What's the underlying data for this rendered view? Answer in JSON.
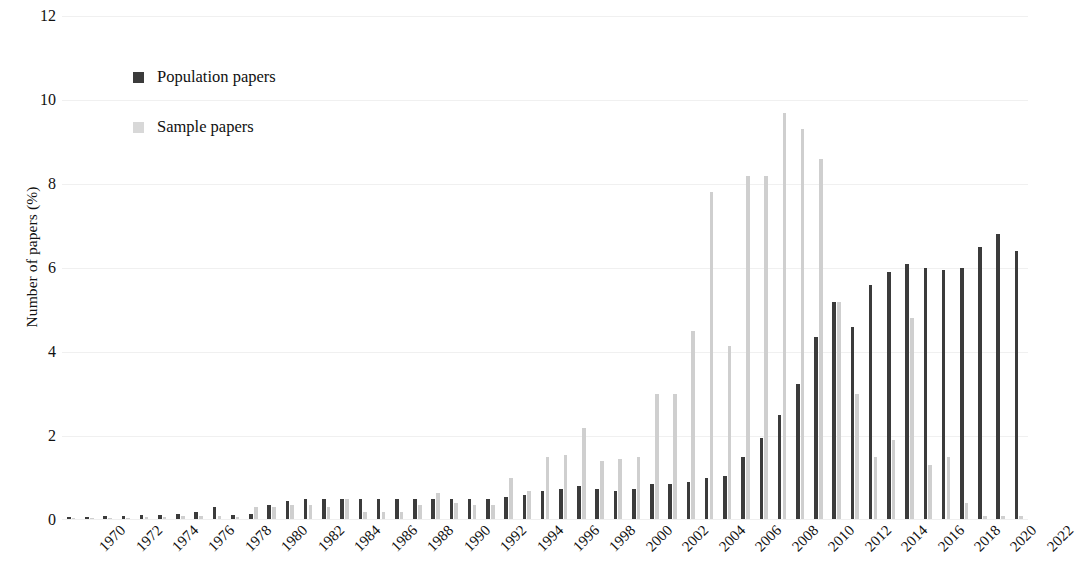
{
  "chart_data": {
    "type": "bar",
    "title": "",
    "xlabel": "",
    "ylabel": "Number of papers (%)",
    "ylim": [
      0,
      12
    ],
    "y_ticks": [
      0,
      2,
      4,
      6,
      8,
      10,
      12
    ],
    "grid": true,
    "legend_position": "upper-left-inside",
    "x": [
      1970,
      1971,
      1972,
      1973,
      1974,
      1975,
      1976,
      1977,
      1978,
      1979,
      1980,
      1981,
      1982,
      1983,
      1984,
      1985,
      1986,
      1987,
      1988,
      1989,
      1990,
      1991,
      1992,
      1993,
      1994,
      1995,
      1996,
      1997,
      1998,
      1999,
      2000,
      2001,
      2002,
      2003,
      2004,
      2005,
      2006,
      2007,
      2008,
      2009,
      2010,
      2011,
      2012,
      2013,
      2014,
      2015,
      2016,
      2017,
      2018,
      2019,
      2020,
      2021,
      2022
    ],
    "x_tick_labels": [
      "1970",
      "1972",
      "1974",
      "1976",
      "1978",
      "1980",
      "1982",
      "1984",
      "1986",
      "1988",
      "1990",
      "1992",
      "1994",
      "1996",
      "1998",
      "2000",
      "2002",
      "2004",
      "2006",
      "2008",
      "2010",
      "2012",
      "2014",
      "2016",
      "2018",
      "2020",
      "2022"
    ],
    "x_tick_values": [
      1970,
      1972,
      1974,
      1976,
      1978,
      1980,
      1982,
      1984,
      1986,
      1988,
      1990,
      1992,
      1994,
      1996,
      1998,
      2000,
      2002,
      2004,
      2006,
      2008,
      2010,
      2012,
      2014,
      2016,
      2018,
      2020,
      2022
    ],
    "series": [
      {
        "name": "Population papers",
        "color": "#3b3b3b",
        "values": [
          0.08,
          0.08,
          0.1,
          0.1,
          0.12,
          0.12,
          0.15,
          0.2,
          0.3,
          0.12,
          0.15,
          0.35,
          0.45,
          0.5,
          0.5,
          0.5,
          0.5,
          0.5,
          0.5,
          0.5,
          0.5,
          0.5,
          0.5,
          0.5,
          0.55,
          0.6,
          0.7,
          0.75,
          0.8,
          0.75,
          0.7,
          0.75,
          0.85,
          0.85,
          0.9,
          1.0,
          1.05,
          1.5,
          1.95,
          2.5,
          3.25,
          4.35,
          5.2,
          4.6,
          5.6,
          5.9,
          6.1,
          6.0,
          5.95,
          6.0,
          6.5,
          6.8,
          6.4
        ]
      },
      {
        "name": "Sample papers",
        "color": "#cfcfcf",
        "values": [
          0.05,
          0.05,
          0.05,
          0.05,
          0.08,
          0.08,
          0.1,
          0.1,
          0.1,
          0.08,
          0.3,
          0.3,
          0.35,
          0.35,
          0.3,
          0.5,
          0.2,
          0.2,
          0.2,
          0.35,
          0.65,
          0.4,
          0.35,
          0.35,
          1.0,
          0.7,
          1.5,
          1.55,
          2.2,
          1.4,
          1.45,
          1.5,
          3.0,
          3.0,
          4.5,
          7.8,
          4.15,
          8.2,
          8.2,
          9.7,
          9.3,
          8.6,
          5.2,
          3.0,
          1.5,
          1.9,
          4.8,
          1.3,
          1.5,
          0.4,
          0.1,
          0.1,
          0.1
        ]
      }
    ]
  },
  "legend": {
    "items": [
      {
        "label": "Population papers",
        "color": "#3b3b3b"
      },
      {
        "label": "Sample papers",
        "color": "#d8d8d8"
      }
    ]
  },
  "axes": {
    "y_title": "Number of papers (%)"
  }
}
